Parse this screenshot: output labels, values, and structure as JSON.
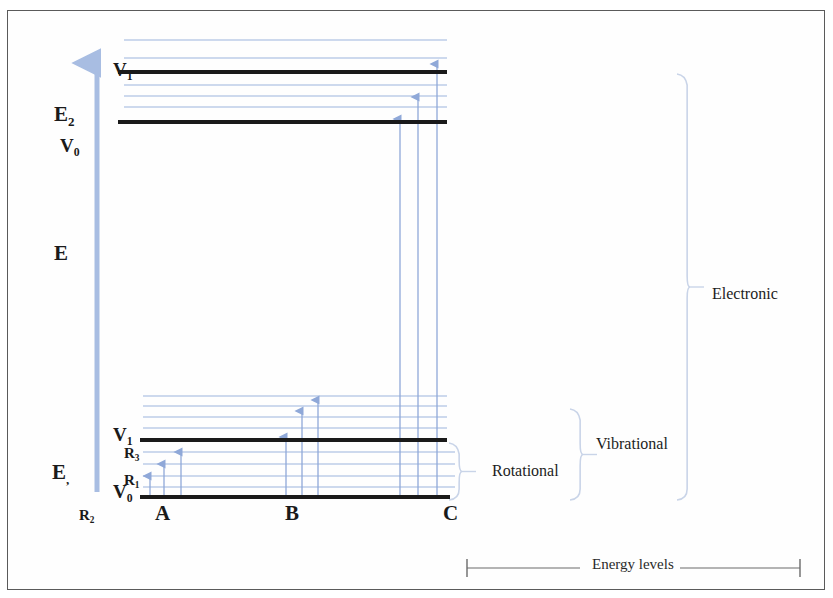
{
  "figure": {
    "kind": "energy-level-diagram"
  },
  "colors": {
    "thick_level": "#1a1a1a",
    "gridline": "#9cb4dd",
    "arrow": "#8fa8d8",
    "axis_arrow": "#a8bde2",
    "brace": "#c9d4e8",
    "text": "#1a1a1a",
    "frame": "#5a5a5a",
    "energy_rule": "#6a6a6a"
  },
  "axis": {
    "name": "E",
    "label": "E",
    "arrow_top_y": 63,
    "arrow_bottom_y": 492,
    "x": 97
  },
  "left_labels": [
    {
      "id": "E2",
      "base": "E",
      "sub": "2",
      "x": 54,
      "y": 104,
      "size": "axis-lbl"
    },
    {
      "id": "V0u",
      "base": "V",
      "sub": "0",
      "x": 60,
      "y": 136,
      "size": "state-lbl"
    },
    {
      "id": "E",
      "base": "E",
      "sub": "",
      "x": 54,
      "y": 243,
      "size": "axis-lbl"
    },
    {
      "id": "E1",
      "base": "E",
      "sub": ",",
      "x": 52,
      "y": 462,
      "size": "axis-lbl"
    },
    {
      "id": "R2",
      "base": "R",
      "sub": "2",
      "x": 79,
      "y": 508,
      "size": "sm-lbl"
    }
  ],
  "level_labels": [
    {
      "id": "V1-upper",
      "base": "V",
      "sub": "1",
      "x": 113,
      "y": 60,
      "size": "state-lbl"
    },
    {
      "id": "V1-lower",
      "base": "V",
      "sub": "1",
      "x": 113,
      "y": 425,
      "size": "state-lbl"
    },
    {
      "id": "R3",
      "base": "R",
      "sub": "3",
      "x": 124,
      "y": 446,
      "size": "sm-lbl"
    },
    {
      "id": "R1",
      "base": "R",
      "sub": "1",
      "x": 124,
      "y": 473,
      "size": "sm-lbl"
    },
    {
      "id": "V0-lower",
      "base": "V",
      "sub": "0",
      "x": 113,
      "y": 482,
      "size": "state-lbl"
    }
  ],
  "thick_levels": [
    {
      "id": "upper-V1",
      "y": 72,
      "x1": 118,
      "x2": 447,
      "label": "V1"
    },
    {
      "id": "upper-E2",
      "y": 122,
      "x1": 118,
      "x2": 447,
      "label": "E2"
    },
    {
      "id": "lower-V1",
      "y": 440,
      "x1": 140,
      "x2": 447,
      "label": "V1"
    },
    {
      "id": "lower-V0",
      "y": 497,
      "x1": 140,
      "x2": 450,
      "label": "V0"
    }
  ],
  "gridlines": [
    {
      "y": 40,
      "x1": 124,
      "x2": 447
    },
    {
      "y": 58,
      "x1": 124,
      "x2": 447
    },
    {
      "y": 85,
      "x1": 124,
      "x2": 447
    },
    {
      "y": 96,
      "x1": 124,
      "x2": 447
    },
    {
      "y": 107,
      "x1": 124,
      "x2": 447
    },
    {
      "y": 396,
      "x1": 143,
      "x2": 447
    },
    {
      "y": 406,
      "x1": 143,
      "x2": 447
    },
    {
      "y": 417,
      "x1": 143,
      "x2": 447
    },
    {
      "y": 428,
      "x1": 143,
      "x2": 447
    },
    {
      "y": 452,
      "x1": 143,
      "x2": 455
    },
    {
      "y": 464,
      "x1": 143,
      "x2": 455
    },
    {
      "y": 476,
      "x1": 143,
      "x2": 455
    },
    {
      "y": 487,
      "x1": 143,
      "x2": 455
    }
  ],
  "transitions": [
    {
      "id": "A-r1",
      "group": "A",
      "x": 150,
      "y_from": 497,
      "y_to": 476,
      "kind": "rotational"
    },
    {
      "id": "A-r2",
      "group": "A",
      "x": 164,
      "y_from": 497,
      "y_to": 464,
      "kind": "rotational"
    },
    {
      "id": "A-r3",
      "group": "A",
      "x": 181,
      "y_from": 497,
      "y_to": 452,
      "kind": "rotational"
    },
    {
      "id": "B-v1",
      "group": "B",
      "x": 286,
      "y_from": 497,
      "y_to": 437,
      "kind": "vibrational"
    },
    {
      "id": "B-v2",
      "group": "B",
      "x": 302,
      "y_from": 497,
      "y_to": 411,
      "kind": "vibrational"
    },
    {
      "id": "B-v3",
      "group": "B",
      "x": 318,
      "y_from": 497,
      "y_to": 400,
      "kind": "vibrational"
    },
    {
      "id": "C-e1",
      "group": "C",
      "x": 400,
      "y_from": 497,
      "y_to": 119,
      "kind": "electronic"
    },
    {
      "id": "C-e2",
      "group": "C",
      "x": 418,
      "y_from": 497,
      "y_to": 97,
      "kind": "electronic"
    },
    {
      "id": "C-e3",
      "group": "C",
      "x": 437,
      "y_from": 497,
      "y_to": 64,
      "kind": "electronic"
    }
  ],
  "column_labels": [
    {
      "id": "A",
      "label": "A",
      "x": 155,
      "y": 503
    },
    {
      "id": "B",
      "label": "B",
      "x": 285,
      "y": 503
    },
    {
      "id": "C",
      "label": "C",
      "x": 443,
      "y": 503
    }
  ],
  "braces": [
    {
      "id": "rotational",
      "label": "Rotational",
      "x": 462,
      "y_top": 443,
      "y_bottom": 500,
      "label_x": 492,
      "label_y": 463
    },
    {
      "id": "vibrational",
      "label": "Vibrational",
      "x": 583,
      "y_top": 409,
      "y_bottom": 500,
      "label_x": 596,
      "label_y": 436
    },
    {
      "id": "electronic",
      "label": "Electronic",
      "x": 690,
      "y_top": 74,
      "y_bottom": 500,
      "label_x": 712,
      "label_y": 286
    }
  ],
  "energy_scale": {
    "label": "Energy levels",
    "x1": 467,
    "x2": 800,
    "y": 568
  }
}
